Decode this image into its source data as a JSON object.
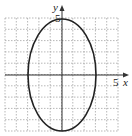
{
  "chart_data": {
    "type": "line",
    "title": "",
    "equation": "x^2/9 + y^2/25 = 1",
    "center": [
      0,
      0
    ],
    "semi_axis_x": 3,
    "semi_axis_y": 5,
    "xlabel": "x",
    "ylabel": "y",
    "xlim": [
      -5,
      5
    ],
    "ylim": [
      -5,
      5
    ],
    "grid": true,
    "grid_step": 1,
    "tick_labels": {
      "x": [
        "5"
      ],
      "y": [
        "5"
      ]
    },
    "series": [
      {
        "name": "ellipse",
        "points": [
          [
            3,
            0
          ],
          [
            0,
            5
          ],
          [
            -3,
            0
          ],
          [
            0,
            -5
          ]
        ]
      }
    ]
  },
  "labels": {
    "x_axis": "x",
    "y_axis": "y",
    "x_tick": "5",
    "y_tick": "5"
  },
  "colors": {
    "grid": "#9a9a9a",
    "axis": "#333333",
    "curve": "#222222"
  }
}
